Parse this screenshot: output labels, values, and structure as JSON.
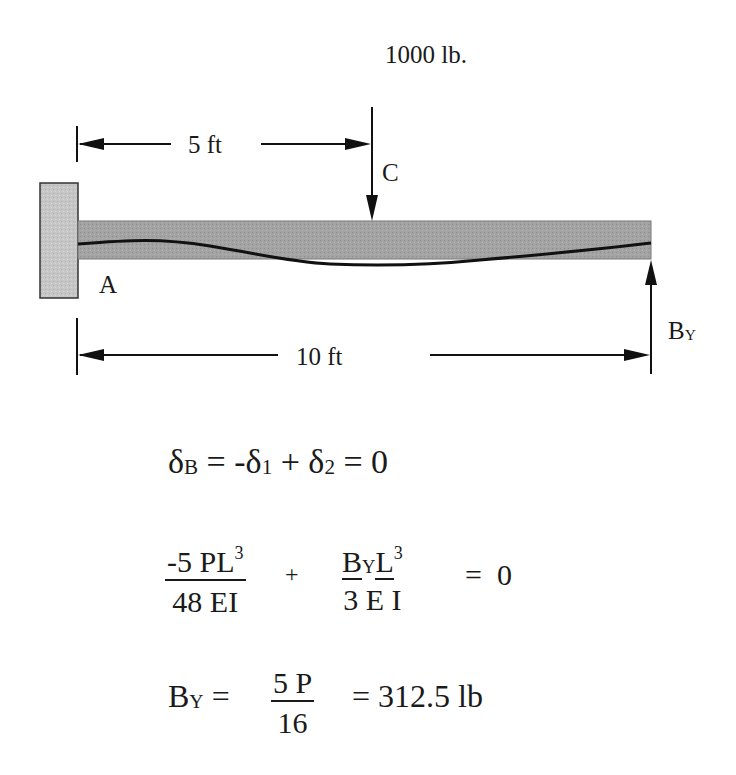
{
  "diagram": {
    "type": "propped cantilever beam with point load",
    "colors": {
      "ink": "#1a1a1a",
      "wall_fill": "#c4c4c4",
      "beam_fill": "#a3a3a3"
    },
    "load": {
      "label": "1000 lb.",
      "point_label": "C"
    },
    "supports": {
      "fixed_label": "A",
      "reaction_label_main": "B",
      "reaction_label_sub": "Y"
    },
    "dimensions": {
      "half_span": "5 ft",
      "full_span": "10 ft"
    }
  },
  "equations": {
    "eq1": {
      "delta": "δ",
      "sub_b": "B",
      "mid": " = -",
      "delta1": "δ",
      "sub_1": "1",
      "plus": " + ",
      "delta2": "δ",
      "sub_2": "2",
      "end": " = 0"
    },
    "eq2": {
      "frac1_num_a": "-5 PL",
      "frac1_num_exp": "3",
      "frac1_den": "48 EI",
      "plus": "+",
      "frac2_num_b": "B",
      "frac2_num_y": "Y",
      "frac2_num_l": "L",
      "frac2_num_exp": "3",
      "frac2_den": "3 E I",
      "equals": "=  0"
    },
    "eq3": {
      "lhs_b": "B",
      "lhs_y": "Y",
      "eq": " = ",
      "frac_num": "5 P",
      "frac_den": "16",
      "rhs": "= 312.5 lb"
    }
  }
}
